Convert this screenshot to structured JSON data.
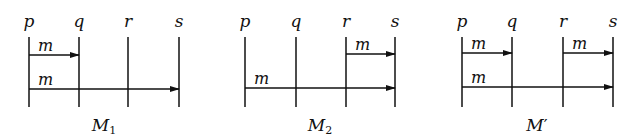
{
  "diagrams": [
    {
      "caption": "M",
      "caption_sub": "1",
      "caption_prime": "",
      "processes": [
        {
          "name": "p",
          "x": 29
        },
        {
          "name": "q",
          "x": 79
        },
        {
          "name": "r",
          "x": 128
        },
        {
          "name": "s",
          "x": 179
        }
      ],
      "messages": [
        {
          "label": "m",
          "from": "p",
          "to": "q",
          "x1": 29,
          "x2": 79,
          "y": 55
        },
        {
          "label": "m",
          "from": "p",
          "to": "s",
          "x1": 29,
          "x2": 179,
          "y": 89
        }
      ],
      "caption_x": 104
    },
    {
      "caption": "M",
      "caption_sub": "2",
      "caption_prime": "",
      "processes": [
        {
          "name": "p",
          "x": 245
        },
        {
          "name": "q",
          "x": 296
        },
        {
          "name": "r",
          "x": 346
        },
        {
          "name": "s",
          "x": 395
        }
      ],
      "messages": [
        {
          "label": "m",
          "from": "r",
          "to": "s",
          "x1": 346,
          "x2": 395,
          "y": 54
        },
        {
          "label": "m",
          "from": "p",
          "to": "s",
          "x1": 245,
          "x2": 395,
          "y": 88
        }
      ],
      "caption_x": 320
    },
    {
      "caption": "M",
      "caption_sub": "",
      "caption_prime": "′",
      "processes": [
        {
          "name": "p",
          "x": 462
        },
        {
          "name": "q",
          "x": 512
        },
        {
          "name": "r",
          "x": 563
        },
        {
          "name": "s",
          "x": 613
        }
      ],
      "messages": [
        {
          "label": "m",
          "from": "p",
          "to": "q",
          "x1": 462,
          "x2": 512,
          "y": 53
        },
        {
          "label": "m",
          "from": "r",
          "to": "s",
          "x1": 563,
          "x2": 613,
          "y": 53
        },
        {
          "label": "m",
          "from": "p",
          "to": "s",
          "x1": 462,
          "x2": 613,
          "y": 87
        }
      ],
      "caption_x": 537
    }
  ],
  "layout": {
    "label_y": 27,
    "line_top": 37,
    "line_bottom": 107,
    "caption_y": 131
  }
}
